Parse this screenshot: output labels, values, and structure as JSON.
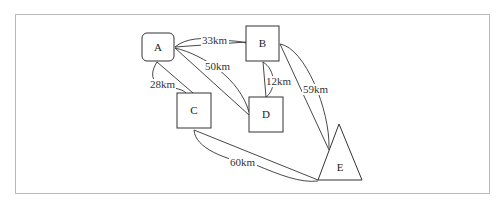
{
  "diagram": {
    "type": "graph",
    "colors": {
      "stroke": "#333333",
      "text": "#222222",
      "frame": "#b8b8b8",
      "background": "#ffffff"
    },
    "nodes": [
      {
        "id": "A",
        "label": "A",
        "shape": "rounded-rectangle"
      },
      {
        "id": "B",
        "label": "B",
        "shape": "square"
      },
      {
        "id": "C",
        "label": "C",
        "shape": "square"
      },
      {
        "id": "D",
        "label": "D",
        "shape": "square"
      },
      {
        "id": "E",
        "label": "E",
        "shape": "triangle"
      }
    ],
    "edges": [
      {
        "from": "A",
        "to": "B",
        "label": "33km"
      },
      {
        "from": "A",
        "to": "C",
        "label": "28km"
      },
      {
        "from": "A",
        "to": "D",
        "label": "50km"
      },
      {
        "from": "B",
        "to": "D",
        "label": "12km"
      },
      {
        "from": "B",
        "to": "E",
        "label": "59km"
      },
      {
        "from": "C",
        "to": "E",
        "label": "60km"
      }
    ]
  }
}
